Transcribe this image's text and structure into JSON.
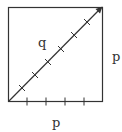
{
  "diagram": {
    "type": "square-with-diagonal",
    "labels": {
      "diagonal": "q",
      "right_side": "p",
      "bottom_side": "p"
    },
    "bottom_tick_count": 4,
    "diagonal_tick_count": 6,
    "stroke_color": "#333333"
  }
}
